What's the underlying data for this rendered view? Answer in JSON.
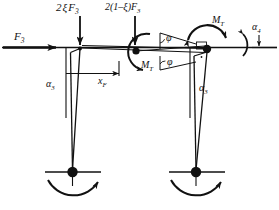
{
  "figure": {
    "type": "free-body-force-diagram",
    "background_color": "#ffffff",
    "stroke_color": "#111111",
    "width": 279,
    "height": 210
  },
  "labels": {
    "force_input": "F",
    "force_input_sub": "3",
    "force_left_vertical": "2",
    "force_left_xi": "ξ",
    "force_left_F": "F",
    "force_left_sub": "3",
    "force_right_prefix": "2(1–",
    "force_right_xi": "ξ",
    "force_right_suffix": ")",
    "force_right_F": "F",
    "force_right_sub": "3",
    "moment_left": "M",
    "moment_left_sub": "T",
    "moment_right": "M",
    "moment_right_sub": "T",
    "angle_alpha3_left": "α",
    "angle_alpha3_left_sub": "3",
    "angle_alpha3_right": "α",
    "angle_alpha3_right_sub": "3",
    "angle_alpha4": "α",
    "angle_alpha4_sub": "4",
    "angle_phi_upper": "φ",
    "angle_phi_lower": "φ",
    "dimension_xF": "x",
    "dimension_xF_sub": "F"
  },
  "elements": {
    "axle_line": "horizontal-reference-axis",
    "left_wheel": "left-wheel-hub",
    "right_wheel": "right-wheel-hub",
    "left_arm": "left-trailing-arm",
    "right_arm": "right-trailing-arm",
    "left_pivot": "left-pivot-point",
    "right_pivot": "right-pivot-point",
    "left_rotation_arc": "left-wheel-rotation-arrow",
    "right_rotation_arc": "right-wheel-rotation-arrow"
  }
}
